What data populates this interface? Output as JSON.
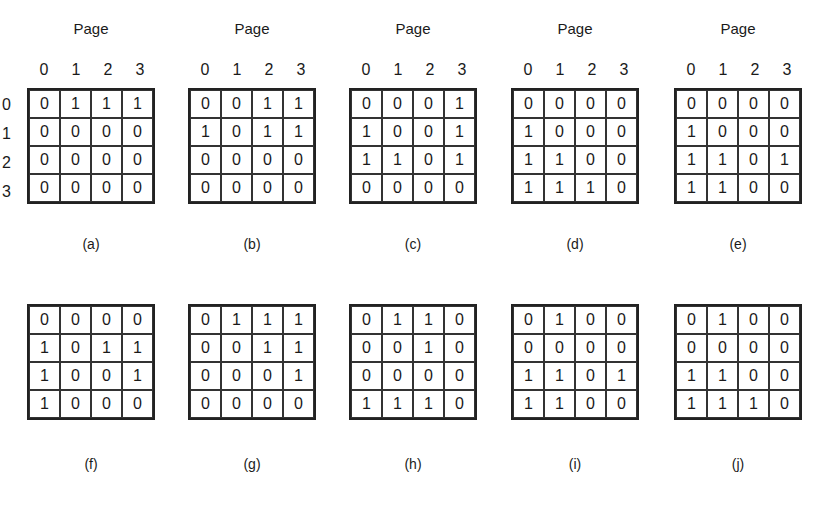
{
  "figure": {
    "axis_title": "Page",
    "col_labels": [
      "0",
      "1",
      "2",
      "3"
    ],
    "row_labels": [
      "0",
      "1",
      "2",
      "3"
    ],
    "matrices": [
      {
        "label": "(a)",
        "rows": [
          [
            "0",
            "1",
            "1",
            "1"
          ],
          [
            "0",
            "0",
            "0",
            "0"
          ],
          [
            "0",
            "0",
            "0",
            "0"
          ],
          [
            "0",
            "0",
            "0",
            "0"
          ]
        ]
      },
      {
        "label": "(b)",
        "rows": [
          [
            "0",
            "0",
            "1",
            "1"
          ],
          [
            "1",
            "0",
            "1",
            "1"
          ],
          [
            "0",
            "0",
            "0",
            "0"
          ],
          [
            "0",
            "0",
            "0",
            "0"
          ]
        ]
      },
      {
        "label": "(c)",
        "rows": [
          [
            "0",
            "0",
            "0",
            "1"
          ],
          [
            "1",
            "0",
            "0",
            "1"
          ],
          [
            "1",
            "1",
            "0",
            "1"
          ],
          [
            "0",
            "0",
            "0",
            "0"
          ]
        ]
      },
      {
        "label": "(d)",
        "rows": [
          [
            "0",
            "0",
            "0",
            "0"
          ],
          [
            "1",
            "0",
            "0",
            "0"
          ],
          [
            "1",
            "1",
            "0",
            "0"
          ],
          [
            "1",
            "1",
            "1",
            "0"
          ]
        ]
      },
      {
        "label": "(e)",
        "rows": [
          [
            "0",
            "0",
            "0",
            "0"
          ],
          [
            "1",
            "0",
            "0",
            "0"
          ],
          [
            "1",
            "1",
            "0",
            "1"
          ],
          [
            "1",
            "1",
            "0",
            "0"
          ]
        ]
      },
      {
        "label": "(f)",
        "rows": [
          [
            "0",
            "0",
            "0",
            "0"
          ],
          [
            "1",
            "0",
            "1",
            "1"
          ],
          [
            "1",
            "0",
            "0",
            "1"
          ],
          [
            "1",
            "0",
            "0",
            "0"
          ]
        ]
      },
      {
        "label": "(g)",
        "rows": [
          [
            "0",
            "1",
            "1",
            "1"
          ],
          [
            "0",
            "0",
            "1",
            "1"
          ],
          [
            "0",
            "0",
            "0",
            "1"
          ],
          [
            "0",
            "0",
            "0",
            "0"
          ]
        ]
      },
      {
        "label": "(h)",
        "rows": [
          [
            "0",
            "1",
            "1",
            "0"
          ],
          [
            "0",
            "0",
            "1",
            "0"
          ],
          [
            "0",
            "0",
            "0",
            "0"
          ],
          [
            "1",
            "1",
            "1",
            "0"
          ]
        ]
      },
      {
        "label": "(i)",
        "rows": [
          [
            "0",
            "1",
            "0",
            "0"
          ],
          [
            "0",
            "0",
            "0",
            "0"
          ],
          [
            "1",
            "1",
            "0",
            "1"
          ],
          [
            "1",
            "1",
            "0",
            "0"
          ]
        ]
      },
      {
        "label": "(j)",
        "rows": [
          [
            "0",
            "1",
            "0",
            "0"
          ],
          [
            "0",
            "0",
            "0",
            "0"
          ],
          [
            "1",
            "1",
            "0",
            "0"
          ],
          [
            "1",
            "1",
            "1",
            "0"
          ]
        ]
      }
    ]
  }
}
